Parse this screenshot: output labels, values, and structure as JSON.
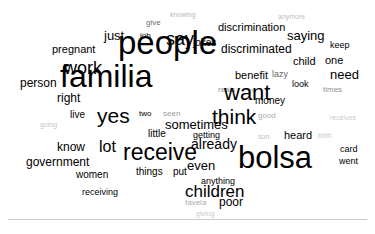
{
  "chart_data": {
    "type": "wordcloud",
    "title": "",
    "subtitle": "",
    "xlabel": "",
    "ylabel": "",
    "background_color": "#ffffff",
    "text_color": "#000000",
    "font_scale_min_px": 5,
    "font_scale_max_px": 33,
    "grid": false,
    "legend": "none",
    "word_count": 61,
    "words": [
      {
        "text": "people",
        "weight": 100,
        "size": 33,
        "opacity": 1.0,
        "x": 118,
        "y": 26
      },
      {
        "text": "familia",
        "weight": 97,
        "size": 32,
        "opacity": 1.0,
        "x": 60,
        "y": 60
      },
      {
        "text": "bolsa",
        "weight": 93,
        "size": 31,
        "opacity": 1.0,
        "x": 238,
        "y": 142
      },
      {
        "text": "receive",
        "weight": 70,
        "size": 23,
        "opacity": 1.0,
        "x": 123,
        "y": 141
      },
      {
        "text": "want",
        "weight": 66,
        "size": 22,
        "opacity": 1.0,
        "x": 224,
        "y": 82
      },
      {
        "text": "yes",
        "weight": 64,
        "size": 21,
        "opacity": 1.0,
        "x": 97,
        "y": 105
      },
      {
        "text": "think",
        "weight": 62,
        "size": 21,
        "opacity": 1.0,
        "x": 212,
        "y": 106
      },
      {
        "text": "say",
        "weight": 54,
        "size": 18,
        "opacity": 1.0,
        "x": 166,
        "y": 30
      },
      {
        "text": "work",
        "weight": 52,
        "size": 18,
        "opacity": 1.0,
        "x": 64,
        "y": 59
      },
      {
        "text": "children",
        "weight": 48,
        "size": 17,
        "opacity": 1.0,
        "x": 185,
        "y": 183
      },
      {
        "text": "lot",
        "weight": 46,
        "size": 16,
        "opacity": 1.0,
        "x": 99,
        "y": 139
      },
      {
        "text": "already",
        "weight": 41,
        "size": 14,
        "opacity": 1.0,
        "x": 191,
        "y": 137
      },
      {
        "text": "sometimes",
        "weight": 40,
        "size": 13,
        "opacity": 1.0,
        "x": 165,
        "y": 118
      },
      {
        "text": "just",
        "weight": 38,
        "size": 13,
        "opacity": 1.0,
        "x": 104,
        "y": 29
      },
      {
        "text": "saying",
        "weight": 38,
        "size": 13,
        "opacity": 1.0,
        "x": 287,
        "y": 29
      },
      {
        "text": "discriminated",
        "weight": 36,
        "size": 12,
        "opacity": 1.0,
        "x": 221,
        "y": 43
      },
      {
        "text": "need",
        "weight": 36,
        "size": 13,
        "opacity": 1.0,
        "x": 330,
        "y": 68
      },
      {
        "text": "even",
        "weight": 35,
        "size": 13,
        "opacity": 1.0,
        "x": 187,
        "y": 159
      },
      {
        "text": "government",
        "weight": 34,
        "size": 12,
        "opacity": 1.0,
        "x": 26,
        "y": 156
      },
      {
        "text": "pregnant",
        "weight": 33,
        "size": 11,
        "opacity": 1.0,
        "x": 52,
        "y": 44
      },
      {
        "text": "person",
        "weight": 33,
        "size": 12,
        "opacity": 1.0,
        "x": 20,
        "y": 77
      },
      {
        "text": "discrimination",
        "weight": 32,
        "size": 11,
        "opacity": 1.0,
        "x": 218,
        "y": 22
      },
      {
        "text": "right",
        "weight": 32,
        "size": 12,
        "opacity": 1.0,
        "x": 57,
        "y": 92
      },
      {
        "text": "know",
        "weight": 32,
        "size": 12,
        "opacity": 1.0,
        "x": 57,
        "y": 141
      },
      {
        "text": "benefit",
        "weight": 31,
        "size": 11,
        "opacity": 1.0,
        "x": 235,
        "y": 70
      },
      {
        "text": "heard",
        "weight": 31,
        "size": 11,
        "opacity": 1.0,
        "x": 284,
        "y": 130
      },
      {
        "text": "poor",
        "weight": 30,
        "size": 12,
        "opacity": 1.0,
        "x": 219,
        "y": 196
      },
      {
        "text": "women",
        "weight": 29,
        "size": 10,
        "opacity": 1.0,
        "x": 76,
        "y": 170
      },
      {
        "text": "child",
        "weight": 28,
        "size": 11,
        "opacity": 1.0,
        "x": 293,
        "y": 56
      },
      {
        "text": "one",
        "weight": 28,
        "size": 11,
        "opacity": 1.0,
        "x": 325,
        "y": 55
      },
      {
        "text": "jokes",
        "weight": 27,
        "size": 10,
        "opacity": 1.0,
        "x": 193,
        "y": 38
      },
      {
        "text": "little",
        "weight": 27,
        "size": 10,
        "opacity": 1.0,
        "x": 148,
        "y": 129
      },
      {
        "text": "things",
        "weight": 27,
        "size": 10,
        "opacity": 1.0,
        "x": 136,
        "y": 167
      },
      {
        "text": "getting",
        "weight": 26,
        "size": 9,
        "opacity": 1.0,
        "x": 193,
        "y": 131
      },
      {
        "text": "money",
        "weight": 26,
        "size": 10,
        "opacity": 1.0,
        "x": 255,
        "y": 96
      },
      {
        "text": "live",
        "weight": 25,
        "size": 10,
        "opacity": 1.0,
        "x": 70,
        "y": 110
      },
      {
        "text": "put",
        "weight": 25,
        "size": 10,
        "opacity": 1.0,
        "x": 173,
        "y": 167
      },
      {
        "text": "anything",
        "weight": 24,
        "size": 9,
        "opacity": 1.0,
        "x": 201,
        "y": 177
      },
      {
        "text": "receiving",
        "weight": 24,
        "size": 9,
        "opacity": 1.0,
        "x": 82,
        "y": 188
      },
      {
        "text": "look",
        "weight": 24,
        "size": 9,
        "opacity": 1.0,
        "x": 292,
        "y": 80
      },
      {
        "text": "keep",
        "weight": 23,
        "size": 9,
        "opacity": 1.0,
        "x": 330,
        "y": 41
      },
      {
        "text": "card",
        "weight": 23,
        "size": 9,
        "opacity": 1.0,
        "x": 340,
        "y": 145
      },
      {
        "text": "went",
        "weight": 23,
        "size": 9,
        "opacity": 1.0,
        "x": 339,
        "y": 157
      },
      {
        "text": "two",
        "weight": 22,
        "size": 8,
        "opacity": 1.0,
        "x": 139,
        "y": 110
      },
      {
        "text": "job",
        "weight": 22,
        "size": 8,
        "opacity": 1.0,
        "x": 140,
        "y": 32
      },
      {
        "text": "give",
        "weight": 21,
        "size": 8,
        "opacity": 0.6,
        "x": 146,
        "y": 19
      },
      {
        "text": "times",
        "weight": 20,
        "size": 8,
        "opacity": 0.45,
        "x": 323,
        "y": 86
      },
      {
        "text": "lazy",
        "weight": 21,
        "size": 9,
        "opacity": 0.62,
        "x": 272,
        "y": 70
      },
      {
        "text": "reais",
        "weight": 19,
        "size": 8,
        "opacity": 0.45,
        "x": 218,
        "y": 86
      },
      {
        "text": "seen",
        "weight": 19,
        "size": 8,
        "opacity": 0.42,
        "x": 163,
        "y": 110
      },
      {
        "text": "good",
        "weight": 18,
        "size": 8,
        "opacity": 0.35,
        "x": 258,
        "y": 112
      },
      {
        "text": "favela",
        "weight": 18,
        "size": 8,
        "opacity": 0.35,
        "x": 185,
        "y": 199
      },
      {
        "text": "anymore",
        "weight": 17,
        "size": 7,
        "opacity": 0.28,
        "x": 278,
        "y": 13
      },
      {
        "text": "knowing",
        "weight": 17,
        "size": 7,
        "opacity": 0.3,
        "x": 170,
        "y": 11
      },
      {
        "text": "son",
        "weight": 16,
        "size": 7,
        "opacity": 0.28,
        "x": 258,
        "y": 133
      },
      {
        "text": "birth",
        "weight": 16,
        "size": 7,
        "opacity": 0.25,
        "x": 318,
        "y": 132
      },
      {
        "text": "receives",
        "weight": 15,
        "size": 7,
        "opacity": 0.22,
        "x": 330,
        "y": 114
      },
      {
        "text": "going",
        "weight": 15,
        "size": 7,
        "opacity": 0.25,
        "x": 40,
        "y": 121
      },
      {
        "text": "giving",
        "weight": 14,
        "size": 7,
        "opacity": 0.22,
        "x": 196,
        "y": 210
      },
      {
        "text": "in",
        "weight": 14,
        "size": 7,
        "opacity": 0.3,
        "x": 248,
        "y": 87
      },
      {
        "text": "to",
        "weight": 13,
        "size": 6,
        "opacity": 0.18,
        "x": 172,
        "y": 153
      }
    ]
  }
}
